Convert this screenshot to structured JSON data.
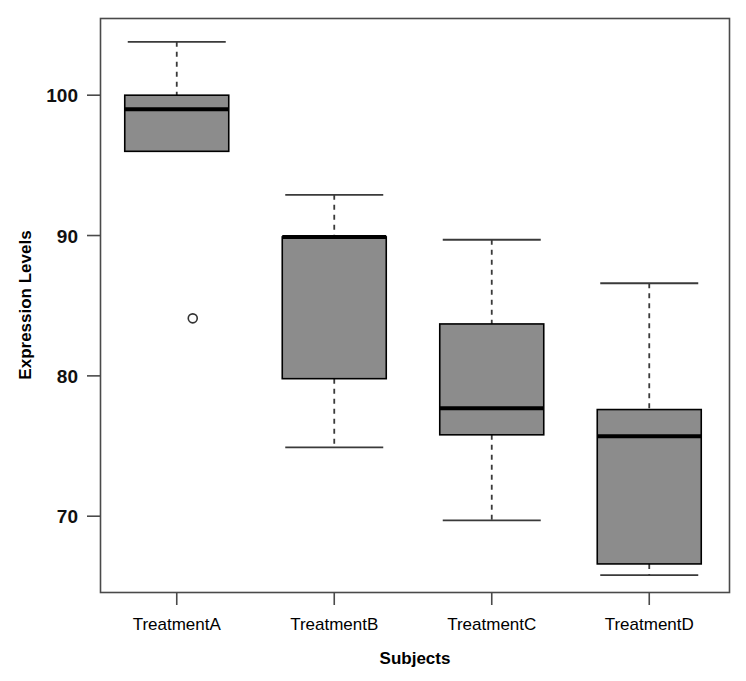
{
  "chart_data": {
    "type": "box",
    "title": "",
    "xlabel": "Subjects",
    "ylabel": "Expression Levels",
    "categories": [
      "TreatmentA",
      "TreatmentB",
      "TreatmentC",
      "TreatmentD"
    ],
    "ylim": [
      64.6,
      105.5
    ],
    "yticks": [
      70,
      80,
      90,
      100
    ],
    "ytick_labels": [
      "70",
      "80",
      "90",
      "100"
    ],
    "grid": false,
    "legend": null,
    "box_fill_color": "#8c8c8c",
    "box_edge_color": "#000000",
    "median_color": "#000000",
    "whisker_style": "dashed",
    "boxes": [
      {
        "label": "TreatmentA",
        "whisker_low": 96.0,
        "q1": 96.0,
        "median": 99.0,
        "q3": 100.0,
        "whisker_high": 103.8,
        "outliers": [
          84.1
        ]
      },
      {
        "label": "TreatmentB",
        "whisker_low": 74.9,
        "q1": 79.8,
        "median": 89.9,
        "q3": 89.9,
        "whisker_high": 92.9,
        "outliers": []
      },
      {
        "label": "TreatmentC",
        "whisker_low": 69.7,
        "q1": 75.8,
        "median": 77.7,
        "q3": 83.7,
        "whisker_high": 89.7,
        "outliers": []
      },
      {
        "label": "TreatmentD",
        "whisker_low": 65.8,
        "q1": 66.6,
        "median": 75.7,
        "q3": 77.6,
        "whisker_high": 86.6,
        "outliers": []
      }
    ]
  }
}
